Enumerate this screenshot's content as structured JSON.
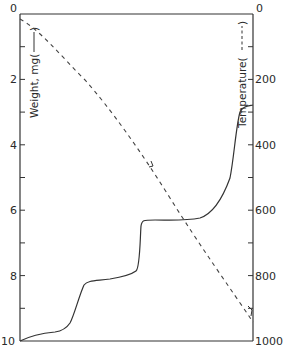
{
  "chart_data": {
    "type": "line",
    "title": "",
    "xlabel": "",
    "ylabel": "Weight, mg (——)",
    "y2label": "Temperature (- - - -)",
    "y_axis": {
      "label": "Weight, mg",
      "legend_style": "solid",
      "range": [
        0,
        10
      ],
      "inverted": true,
      "tick_labels": [
        "0",
        "2",
        "4",
        "6",
        "8",
        "10"
      ],
      "tick_values": [
        0,
        1,
        2,
        3,
        4,
        5,
        6,
        7,
        8,
        9,
        10
      ]
    },
    "y2_axis": {
      "label": "Temperature",
      "legend_style": "dashed",
      "range": [
        0,
        1000
      ],
      "inverted": true,
      "tick_labels": [
        "0",
        "200",
        "400",
        "600",
        "800",
        "1000"
      ],
      "tick_values": [
        0,
        100,
        200,
        300,
        400,
        500,
        600,
        700,
        800,
        900,
        1000
      ]
    },
    "grid": false,
    "legend_position": "axis labels",
    "series": [
      {
        "name": "Weight, mg",
        "style": "solid",
        "axis": "left",
        "x_fraction": [
          0.0,
          0.05,
          0.1,
          0.15,
          0.2,
          0.23,
          0.27,
          0.3,
          0.35,
          0.45,
          0.55,
          0.5,
          0.52,
          0.53,
          0.54,
          0.56,
          0.65,
          0.73,
          0.78,
          0.83,
          0.88,
          0.92,
          0.95,
          1.0
        ],
        "values": [
          10.0,
          9.8,
          9.7,
          9.65,
          9.5,
          9.0,
          8.4,
          8.2,
          8.15,
          8.05,
          7.9,
          7.95,
          7.85,
          7.0,
          6.5,
          6.35,
          6.35,
          6.3,
          6.1,
          5.5,
          4.7,
          4.0,
          3.75,
          3.7
        ]
      },
      {
        "name": "Temperature",
        "style": "dashed",
        "axis": "right",
        "x_fraction": [
          0.0,
          0.1,
          0.2,
          0.3,
          0.4,
          0.5,
          0.6,
          0.7,
          0.8,
          0.9,
          1.0
        ],
        "values": [
          10,
          80,
          175,
          270,
          370,
          470,
          560,
          650,
          740,
          840,
          940
        ]
      }
    ],
    "annotations": [
      {
        "type": "arrow",
        "series": "Temperature",
        "x_fraction": 0.52,
        "value": 470
      },
      {
        "type": "arrow",
        "series": "Temperature",
        "x_fraction": 0.98,
        "value": 925
      }
    ]
  }
}
